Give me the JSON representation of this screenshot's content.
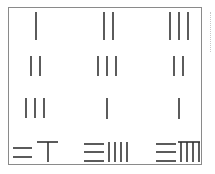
{
  "puzzle": {
    "title": "",
    "stroke_color": "#333333",
    "frame_color": "#8a8a8a",
    "grid": [
      [
        {
          "value": 1,
          "rods": "1"
        },
        {
          "value": 2,
          "rods": "2"
        },
        {
          "value": 3,
          "rods": "3"
        }
      ],
      [
        {
          "value": 2,
          "rods": "2"
        },
        {
          "value": 3,
          "rods": "3"
        },
        {
          "value": 2,
          "rods": "2"
        }
      ],
      [
        {
          "value": 3,
          "rods": "3"
        },
        {
          "value": 1,
          "rods": "1"
        },
        {
          "value": 1,
          "rods": "1"
        }
      ],
      [
        {
          "value": 26,
          "rods": "=T"
        },
        {
          "value": 34,
          "rods": "≡||||"
        },
        {
          "value": 39,
          "rods": "≡Ⅲ"
        }
      ]
    ]
  }
}
